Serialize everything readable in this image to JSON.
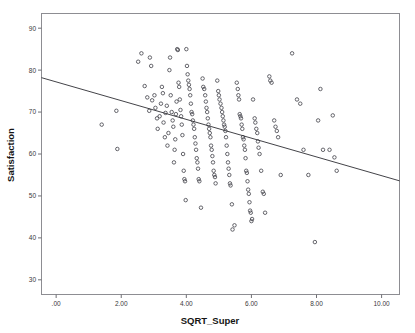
{
  "chart_data": {
    "type": "scatter",
    "title": "",
    "xlabel": "SQRT_Super",
    "ylabel": "Satisfaction",
    "xlim": [
      -0.45,
      10.55
    ],
    "ylim": [
      26.5,
      93.5
    ],
    "grid": false,
    "legend": null,
    "xticks": [
      0,
      2,
      4,
      6,
      8,
      10
    ],
    "xtick_labels": [
      ".00",
      "2.00",
      "4.00",
      "6.00",
      "8.00",
      "10.00"
    ],
    "yticks": [
      30,
      40,
      50,
      60,
      70,
      80,
      90
    ],
    "ytick_labels": [
      "30",
      "40",
      "50",
      "60",
      "70",
      "80",
      "90"
    ],
    "marker": "open-circle",
    "marker_color": "#4a4a52",
    "fit_line": {
      "name": "linear fit",
      "color": "#2e2e33",
      "x": [
        -0.45,
        10.55
      ],
      "y": [
        78.2,
        53.6
      ],
      "slope": -2.236,
      "intercept": 77.19
    },
    "series": [
      {
        "name": "Satisfaction vs SQRT_Super",
        "points": [
          [
            1.4,
            67.0
          ],
          [
            1.85,
            70.3
          ],
          [
            1.88,
            61.2
          ],
          [
            2.52,
            82.0
          ],
          [
            2.62,
            84.0
          ],
          [
            2.88,
            83.0
          ],
          [
            2.92,
            81.0
          ],
          [
            2.8,
            73.5
          ],
          [
            2.86,
            70.3
          ],
          [
            2.72,
            76.2
          ],
          [
            2.95,
            72.8
          ],
          [
            3.02,
            74.0
          ],
          [
            3.05,
            71.0
          ],
          [
            3.1,
            68.5
          ],
          [
            3.12,
            66.0
          ],
          [
            3.18,
            69.0
          ],
          [
            3.22,
            72.0
          ],
          [
            3.25,
            76.0
          ],
          [
            3.28,
            74.5
          ],
          [
            3.3,
            67.5
          ],
          [
            3.34,
            64.0
          ],
          [
            3.36,
            69.8
          ],
          [
            3.4,
            71.5
          ],
          [
            3.42,
            62.0
          ],
          [
            3.45,
            65.0
          ],
          [
            3.48,
            80.0
          ],
          [
            3.5,
            83.0
          ],
          [
            3.52,
            74.0
          ],
          [
            3.55,
            70.0
          ],
          [
            3.58,
            68.0
          ],
          [
            3.6,
            66.5
          ],
          [
            3.62,
            58.0
          ],
          [
            3.64,
            61.0
          ],
          [
            3.66,
            63.5
          ],
          [
            3.68,
            69.5
          ],
          [
            3.7,
            72.5
          ],
          [
            3.72,
            85.0
          ],
          [
            3.74,
            84.8
          ],
          [
            3.76,
            77.0
          ],
          [
            3.78,
            76.0
          ],
          [
            3.8,
            73.0
          ],
          [
            3.82,
            70.5
          ],
          [
            3.84,
            69.0
          ],
          [
            3.86,
            67.0
          ],
          [
            3.88,
            64.5
          ],
          [
            3.9,
            60.0
          ],
          [
            3.92,
            56.0
          ],
          [
            3.94,
            54.0
          ],
          [
            3.96,
            53.5
          ],
          [
            3.98,
            49.0
          ],
          [
            4.0,
            85.0
          ],
          [
            4.02,
            81.0
          ],
          [
            4.04,
            79.0
          ],
          [
            4.06,
            77.5
          ],
          [
            4.08,
            76.5
          ],
          [
            4.1,
            75.5
          ],
          [
            4.12,
            74.0
          ],
          [
            4.14,
            72.0
          ],
          [
            4.16,
            70.0
          ],
          [
            4.18,
            69.5
          ],
          [
            4.2,
            68.0
          ],
          [
            4.22,
            67.0
          ],
          [
            4.24,
            66.0
          ],
          [
            4.26,
            64.0
          ],
          [
            4.28,
            62.5
          ],
          [
            4.3,
            61.0
          ],
          [
            4.32,
            59.0
          ],
          [
            4.34,
            58.0
          ],
          [
            4.36,
            56.5
          ],
          [
            4.38,
            54.0
          ],
          [
            4.4,
            53.5
          ],
          [
            4.45,
            47.2
          ],
          [
            4.5,
            78.0
          ],
          [
            4.52,
            76.0
          ],
          [
            4.55,
            75.5
          ],
          [
            4.58,
            74.0
          ],
          [
            4.6,
            72.5
          ],
          [
            4.62,
            71.0
          ],
          [
            4.64,
            70.0
          ],
          [
            4.66,
            68.5
          ],
          [
            4.68,
            67.0
          ],
          [
            4.7,
            66.0
          ],
          [
            4.72,
            65.0
          ],
          [
            4.74,
            64.0
          ],
          [
            4.76,
            62.0
          ],
          [
            4.78,
            61.0
          ],
          [
            4.8,
            59.5
          ],
          [
            4.82,
            58.0
          ],
          [
            4.84,
            56.0
          ],
          [
            4.86,
            55.0
          ],
          [
            4.88,
            54.5
          ],
          [
            4.9,
            53.0
          ],
          [
            4.95,
            77.5
          ],
          [
            4.98,
            75.0
          ],
          [
            5.0,
            74.0
          ],
          [
            5.02,
            73.0
          ],
          [
            5.05,
            72.0
          ],
          [
            5.08,
            71.0
          ],
          [
            5.1,
            70.0
          ],
          [
            5.12,
            69.0
          ],
          [
            5.14,
            68.0
          ],
          [
            5.16,
            67.0
          ],
          [
            5.18,
            66.5
          ],
          [
            5.2,
            65.5
          ],
          [
            5.22,
            64.0
          ],
          [
            5.24,
            62.0
          ],
          [
            5.26,
            60.0
          ],
          [
            5.28,
            58.0
          ],
          [
            5.3,
            56.5
          ],
          [
            5.32,
            55.0
          ],
          [
            5.34,
            53.0
          ],
          [
            5.36,
            52.5
          ],
          [
            5.4,
            48.0
          ],
          [
            5.42,
            42.0
          ],
          [
            5.48,
            43.0
          ],
          [
            5.55,
            77.0
          ],
          [
            5.58,
            75.5
          ],
          [
            5.6,
            74.0
          ],
          [
            5.62,
            73.0
          ],
          [
            5.64,
            69.5
          ],
          [
            5.66,
            69.0
          ],
          [
            5.68,
            68.5
          ],
          [
            5.7,
            67.0
          ],
          [
            5.72,
            66.0
          ],
          [
            5.74,
            64.0
          ],
          [
            5.76,
            63.5
          ],
          [
            5.78,
            62.0
          ],
          [
            5.8,
            61.0
          ],
          [
            5.82,
            59.0
          ],
          [
            5.84,
            56.0
          ],
          [
            5.86,
            55.5
          ],
          [
            5.88,
            53.5
          ],
          [
            5.9,
            51.5
          ],
          [
            5.92,
            50.5
          ],
          [
            5.94,
            48.5
          ],
          [
            5.96,
            46.5
          ],
          [
            5.98,
            46.0
          ],
          [
            6.0,
            44.0
          ],
          [
            6.02,
            44.5
          ],
          [
            6.05,
            73.0
          ],
          [
            6.1,
            68.5
          ],
          [
            6.12,
            67.5
          ],
          [
            6.15,
            66.0
          ],
          [
            6.18,
            65.0
          ],
          [
            6.2,
            63.0
          ],
          [
            6.22,
            61.5
          ],
          [
            6.25,
            60.0
          ],
          [
            6.3,
            56.0
          ],
          [
            6.35,
            51.0
          ],
          [
            6.38,
            50.5
          ],
          [
            6.42,
            46.0
          ],
          [
            6.55,
            78.5
          ],
          [
            6.58,
            77.5
          ],
          [
            6.62,
            77.0
          ],
          [
            6.7,
            68.0
          ],
          [
            6.74,
            66.5
          ],
          [
            6.78,
            65.5
          ],
          [
            6.82,
            64.0
          ],
          [
            6.9,
            55.0
          ],
          [
            7.25,
            84.0
          ],
          [
            7.4,
            73.0
          ],
          [
            7.5,
            72.0
          ],
          [
            7.6,
            61.0
          ],
          [
            7.75,
            55.0
          ],
          [
            8.05,
            68.0
          ],
          [
            8.12,
            75.5
          ],
          [
            8.2,
            61.0
          ],
          [
            8.4,
            61.0
          ],
          [
            8.5,
            69.2
          ],
          [
            8.55,
            59.2
          ],
          [
            8.62,
            56.0
          ],
          [
            7.95,
            39.0
          ]
        ]
      }
    ]
  },
  "labels": {
    "x_axis_title": "SQRT_Super",
    "y_axis_title": "Satisfaction"
  }
}
